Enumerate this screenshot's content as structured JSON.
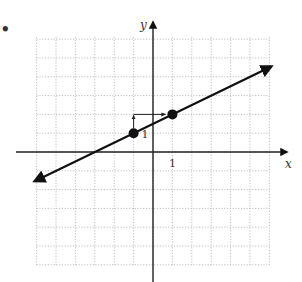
{
  "chart_data": {
    "type": "line",
    "title": "",
    "xlabel": "x",
    "ylabel": "y",
    "xlim": [
      -6,
      6
    ],
    "ylim": [
      -6,
      6
    ],
    "grid": true,
    "grid_style": "dotted",
    "tick_labels": {
      "x": [
        "1"
      ],
      "y": [
        "1"
      ]
    },
    "series": [
      {
        "name": "line",
        "equation": "y = 0.5x + 1.5",
        "slope": 0.5,
        "y_intercept": 1.5,
        "x_intercept": -3,
        "arrows_both_ends": true,
        "x": [
          -6.1,
          6.1
        ],
        "y": [
          -1.55,
          4.55
        ]
      }
    ],
    "points": [
      {
        "x": -1,
        "y": 1
      },
      {
        "x": 1,
        "y": 2
      }
    ],
    "annotations": [
      {
        "type": "rise-arrow",
        "from": [
          -1,
          1
        ],
        "to": [
          -1,
          2
        ],
        "label": "1"
      },
      {
        "type": "run-arrow",
        "from": [
          -1,
          2
        ],
        "to": [
          1,
          2
        ],
        "label": ""
      }
    ]
  },
  "labels": {
    "x_axis": "x",
    "y_axis": "y",
    "x_tick": "1",
    "rise": "1",
    "bullet": "•"
  },
  "colors": {
    "line": "#111111",
    "grid": "#b8b8b8",
    "axis": "#222222",
    "point": "#111111"
  }
}
